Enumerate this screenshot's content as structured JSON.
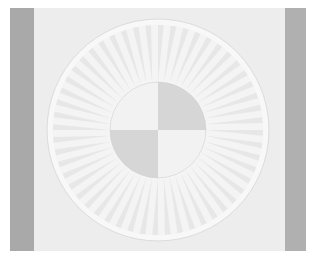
{
  "image": {
    "subject": "white quilted sunburst block",
    "width": 314,
    "height": 258
  },
  "colors": {
    "background": "#ffffff",
    "fabric": "#ededed",
    "border_strip_left": "#a9a9a9",
    "border_strip_right": "#b0b0b0",
    "ring": "#f8f8f8",
    "spoke_light": "#f4f4f4",
    "spoke_dark": "#dcdcdc",
    "quadrant_light": "#f2f2f2",
    "quadrant_dark": "#d6d6d6"
  },
  "geometry": {
    "center_x": 158,
    "center_y": 130,
    "outer_radius": 108,
    "ring_width": 5,
    "inner_radius": 48,
    "spoke_count": 52
  },
  "quadrants": [
    {
      "name": "top-left",
      "tone": "light"
    },
    {
      "name": "top-right",
      "tone": "dark"
    },
    {
      "name": "bottom-left",
      "tone": "dark"
    },
    {
      "name": "bottom-right",
      "tone": "light"
    }
  ]
}
